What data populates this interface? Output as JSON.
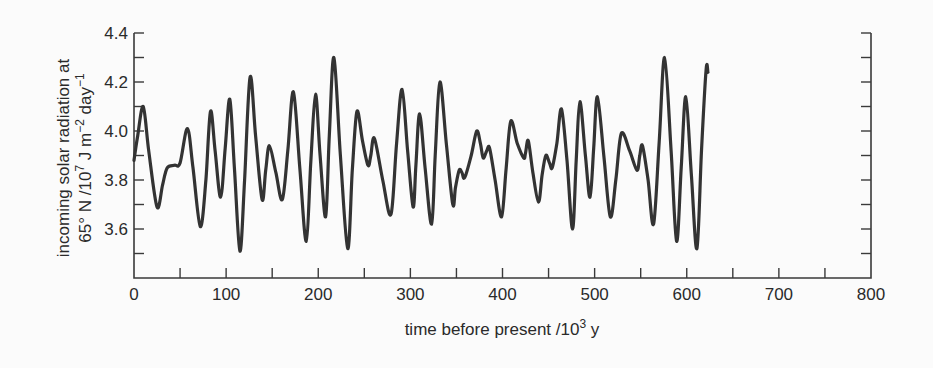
{
  "chart_data": {
    "type": "line",
    "title": "",
    "xlabel": "time before present /10³ y",
    "xlabel_parts": {
      "prefix": "time before present /10",
      "sup": "3",
      "suffix": " y"
    },
    "ylabel_line1": "incoming solar radiation at",
    "ylabel_line2_parts": {
      "a": "65° N /10",
      "sup1": "7",
      "b": " J m",
      "sup2": "−2",
      "c": " day",
      "sup3": "−1"
    },
    "ylabel": "incoming solar radiation at 65° N /10⁷ J m⁻² day⁻¹",
    "xlim": [
      0,
      800
    ],
    "ylim": [
      3.45,
      4.4
    ],
    "x_ticks": [
      0,
      100,
      200,
      300,
      400,
      500,
      600,
      700,
      800
    ],
    "x_tick_labels": [
      "0",
      "100",
      "200",
      "300",
      "400",
      "500",
      "600",
      "700",
      "800"
    ],
    "x_minor_ticks": [
      50,
      150,
      250,
      350,
      450,
      550,
      650,
      750
    ],
    "y_ticks": [
      3.6,
      3.8,
      4.0,
      4.2,
      4.4
    ],
    "y_tick_labels": [
      "3.6",
      "3.8",
      "4.0",
      "4.2",
      "4.4"
    ],
    "y_minor_ticks": [
      3.5,
      3.7,
      3.9,
      4.1,
      4.3
    ],
    "grid": false,
    "legend": null,
    "right_axis_ticks": true,
    "series": [
      {
        "name": "insolation 65N",
        "color": "#333333",
        "x": [
          0,
          4,
          10,
          16,
          25,
          31,
          36,
          44,
          50,
          58,
          64,
          72,
          78,
          83,
          88,
          94,
          99,
          104,
          109,
          115,
          120,
          126,
          132,
          139,
          143,
          147,
          154,
          161,
          167,
          173,
          180,
          187,
          192,
          197,
          202,
          208,
          212,
          217,
          224,
          232,
          237,
          242,
          248,
          254,
          257,
          261,
          270,
          279,
          285,
          291,
          297,
          303,
          306,
          310,
          316,
          323,
          327,
          332,
          339,
          346,
          349,
          353,
          356,
          359,
          366,
          372,
          376,
          379,
          383,
          386,
          392,
          399,
          404,
          409,
          416,
          423,
          425,
          428,
          433,
          439,
          443,
          447,
          451,
          454,
          459,
          464,
          470,
          476,
          480,
          484,
          490,
          495,
          499,
          503,
          510,
          517,
          523,
          529,
          538,
          546,
          549,
          552,
          558,
          564,
          570,
          576,
          583,
          589,
          594,
          599,
          605,
          611,
          616,
          621,
          623
        ],
        "y": [
          3.88,
          3.98,
          4.1,
          3.92,
          3.69,
          3.78,
          3.85,
          3.86,
          3.87,
          4.01,
          3.85,
          3.61,
          3.8,
          4.08,
          3.92,
          3.73,
          3.93,
          4.13,
          3.85,
          3.51,
          3.8,
          4.22,
          3.98,
          3.72,
          3.84,
          3.94,
          3.83,
          3.72,
          3.92,
          4.16,
          3.85,
          3.55,
          3.88,
          4.15,
          3.9,
          3.65,
          3.98,
          4.3,
          3.9,
          3.52,
          3.84,
          4.08,
          3.96,
          3.86,
          3.9,
          3.97,
          3.8,
          3.66,
          3.95,
          4.17,
          3.92,
          3.69,
          3.86,
          4.07,
          3.85,
          3.62,
          3.9,
          4.2,
          3.95,
          3.7,
          3.77,
          3.84,
          3.83,
          3.81,
          3.9,
          4.0,
          3.95,
          3.89,
          3.92,
          3.93,
          3.8,
          3.65,
          3.85,
          4.04,
          3.95,
          3.89,
          3.91,
          3.96,
          3.83,
          3.71,
          3.82,
          3.9,
          3.87,
          3.85,
          3.95,
          4.09,
          3.88,
          3.6,
          3.88,
          4.12,
          3.9,
          3.73,
          3.93,
          4.14,
          3.9,
          3.65,
          3.8,
          3.99,
          3.92,
          3.84,
          3.9,
          3.94,
          3.8,
          3.62,
          3.95,
          4.3,
          3.92,
          3.55,
          3.85,
          4.14,
          3.82,
          3.52,
          3.92,
          4.25,
          4.24
        ]
      }
    ]
  },
  "colors": {
    "background": "#fbfbfb",
    "axis": "#3a3a3a",
    "line": "#333333",
    "text": "#2a2a2a"
  }
}
